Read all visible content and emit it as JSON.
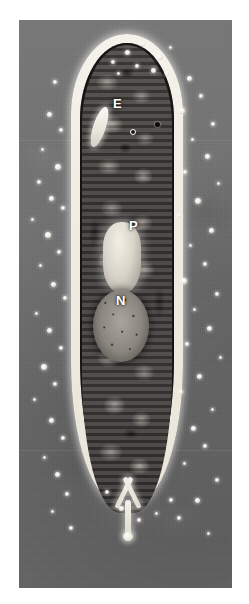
{
  "figure": {
    "kind": "light-micrograph",
    "background_color": "#6e6e6e",
    "page_color": "#ffffff",
    "label_color": "#ffffff"
  },
  "plate": {
    "left": 19,
    "top": 20,
    "width": 213,
    "height": 568
  },
  "labels": [
    {
      "text": "E",
      "name": "label-e",
      "meaning": "vacuole",
      "x": 113,
      "y": 97
    },
    {
      "text": "P",
      "name": "label-p",
      "meaning": "bright-capsule-organelle",
      "x": 129,
      "y": 219
    },
    {
      "text": "N",
      "name": "label-n",
      "meaning": "nucleus",
      "x": 116,
      "y": 294
    }
  ],
  "markers": [
    {
      "name": "marker-ring",
      "style": "white-ringed-dot",
      "x": 130,
      "y": 129
    },
    {
      "name": "marker-dot",
      "style": "solid-dark-dot",
      "x": 155,
      "y": 122
    }
  ],
  "organelles": [
    {
      "name": "vacuole-e",
      "label": "E",
      "shape": "elongated-bright-rod"
    },
    {
      "name": "organelle-p",
      "label": "P",
      "shape": "bright-rounded-capsule"
    },
    {
      "name": "nucleus-n",
      "label": "N",
      "shape": "granular-oval"
    },
    {
      "name": "caudal-spine",
      "label": "",
      "shape": "y-shaped-bright-spine"
    }
  ],
  "specks_left": [
    {
      "x": 34,
      "y": 60,
      "d": 4
    },
    {
      "x": 28,
      "y": 92,
      "d": 5
    },
    {
      "x": 40,
      "y": 108,
      "d": 4
    },
    {
      "x": 22,
      "y": 128,
      "d": 3
    },
    {
      "x": 36,
      "y": 144,
      "d": 6
    },
    {
      "x": 18,
      "y": 160,
      "d": 4
    },
    {
      "x": 30,
      "y": 176,
      "d": 5
    },
    {
      "x": 42,
      "y": 186,
      "d": 4
    },
    {
      "x": 12,
      "y": 198,
      "d": 3
    },
    {
      "x": 26,
      "y": 212,
      "d": 6
    },
    {
      "x": 38,
      "y": 230,
      "d": 4
    },
    {
      "x": 20,
      "y": 244,
      "d": 3
    },
    {
      "x": 32,
      "y": 262,
      "d": 5
    },
    {
      "x": 44,
      "y": 276,
      "d": 4
    },
    {
      "x": 16,
      "y": 292,
      "d": 3
    },
    {
      "x": 28,
      "y": 308,
      "d": 5
    },
    {
      "x": 40,
      "y": 326,
      "d": 4
    },
    {
      "x": 22,
      "y": 344,
      "d": 6
    },
    {
      "x": 34,
      "y": 362,
      "d": 4
    },
    {
      "x": 14,
      "y": 378,
      "d": 3
    },
    {
      "x": 30,
      "y": 398,
      "d": 5
    },
    {
      "x": 42,
      "y": 416,
      "d": 4
    },
    {
      "x": 24,
      "y": 436,
      "d": 3
    },
    {
      "x": 36,
      "y": 452,
      "d": 5
    },
    {
      "x": 46,
      "y": 472,
      "d": 4
    },
    {
      "x": 32,
      "y": 490,
      "d": 3
    },
    {
      "x": 50,
      "y": 506,
      "d": 4
    }
  ],
  "specks_right": [
    {
      "x": 168,
      "y": 56,
      "d": 5
    },
    {
      "x": 180,
      "y": 74,
      "d": 4
    },
    {
      "x": 160,
      "y": 88,
      "d": 6
    },
    {
      "x": 192,
      "y": 102,
      "d": 4
    },
    {
      "x": 172,
      "y": 118,
      "d": 3
    },
    {
      "x": 186,
      "y": 134,
      "d": 5
    },
    {
      "x": 164,
      "y": 150,
      "d": 4
    },
    {
      "x": 198,
      "y": 162,
      "d": 3
    },
    {
      "x": 176,
      "y": 178,
      "d": 6
    },
    {
      "x": 158,
      "y": 194,
      "d": 4
    },
    {
      "x": 190,
      "y": 208,
      "d": 5
    },
    {
      "x": 170,
      "y": 224,
      "d": 3
    },
    {
      "x": 184,
      "y": 242,
      "d": 4
    },
    {
      "x": 162,
      "y": 258,
      "d": 6
    },
    {
      "x": 196,
      "y": 272,
      "d": 4
    },
    {
      "x": 174,
      "y": 288,
      "d": 3
    },
    {
      "x": 188,
      "y": 306,
      "d": 5
    },
    {
      "x": 166,
      "y": 322,
      "d": 4
    },
    {
      "x": 200,
      "y": 336,
      "d": 3
    },
    {
      "x": 178,
      "y": 354,
      "d": 5
    },
    {
      "x": 160,
      "y": 370,
      "d": 4
    },
    {
      "x": 192,
      "y": 388,
      "d": 3
    },
    {
      "x": 172,
      "y": 406,
      "d": 5
    },
    {
      "x": 184,
      "y": 424,
      "d": 4
    },
    {
      "x": 164,
      "y": 442,
      "d": 3
    },
    {
      "x": 196,
      "y": 458,
      "d": 4
    },
    {
      "x": 176,
      "y": 478,
      "d": 5
    },
    {
      "x": 158,
      "y": 496,
      "d": 4
    },
    {
      "x": 188,
      "y": 512,
      "d": 3
    }
  ],
  "specks_margin": [
    {
      "x": 106,
      "y": 30,
      "d": 5
    },
    {
      "x": 122,
      "y": 22,
      "d": 4
    },
    {
      "x": 138,
      "y": 34,
      "d": 6
    },
    {
      "x": 92,
      "y": 40,
      "d": 4
    },
    {
      "x": 150,
      "y": 26,
      "d": 3
    },
    {
      "x": 116,
      "y": 44,
      "d": 4
    },
    {
      "x": 132,
      "y": 48,
      "d": 5
    },
    {
      "x": 98,
      "y": 52,
      "d": 3
    },
    {
      "x": 146,
      "y": 52,
      "d": 4
    },
    {
      "x": 86,
      "y": 470,
      "d": 4
    },
    {
      "x": 100,
      "y": 486,
      "d": 5
    },
    {
      "x": 118,
      "y": 498,
      "d": 4
    },
    {
      "x": 136,
      "y": 492,
      "d": 3
    },
    {
      "x": 150,
      "y": 478,
      "d": 4
    }
  ],
  "seams": [
    {
      "y": 120
    },
    {
      "y": 430
    }
  ]
}
